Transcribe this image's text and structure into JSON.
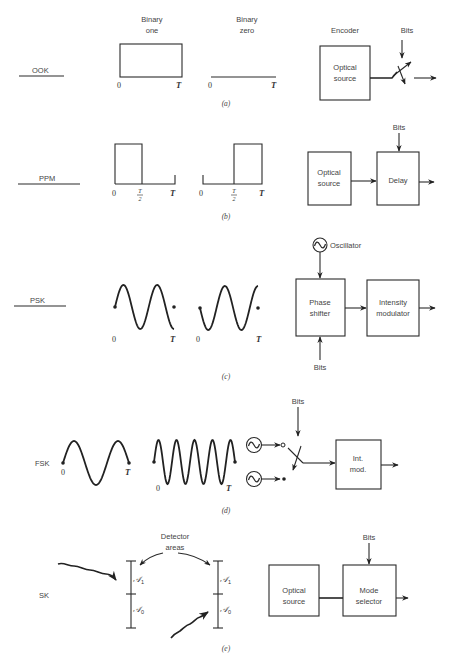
{
  "figure": {
    "panels": [
      {
        "id": "a",
        "caption": "(a)",
        "scheme": "OOK",
        "binary_one_label": "Binary\none",
        "binary_one_line1": "Binary",
        "binary_one_line2": "one",
        "binary_zero_line1": "Binary",
        "binary_zero_line2": "zero",
        "axis_start": "0",
        "axis_end": "T",
        "encoder_label": "Encoder",
        "source_line1": "Optical",
        "source_line2": "source",
        "bits_label": "Bits"
      },
      {
        "id": "b",
        "caption": "(b)",
        "scheme": "PPM",
        "axis_start": "0",
        "axis_mid_num": "T",
        "axis_mid_den": "2",
        "axis_end": "T",
        "source_line1": "Optical",
        "source_line2": "source",
        "delay_label": "Delay",
        "bits_label": "Bits"
      },
      {
        "id": "c",
        "caption": "(c)",
        "scheme": "PSK",
        "axis_start": "0",
        "axis_end": "T",
        "oscillator_label": "Oscillator",
        "shifter_line1": "Phase",
        "shifter_line2": "shifter",
        "modulator_line1": "Intensity",
        "modulator_line2": "modulator",
        "bits_label": "Bits"
      },
      {
        "id": "d",
        "caption": "(d)",
        "scheme": "FSK",
        "axis_start": "0",
        "axis_end": "T",
        "bits_label": "Bits",
        "mod_line1": "Int.",
        "mod_line2": "mod."
      },
      {
        "id": "e",
        "caption": "(e)",
        "scheme": "SK",
        "detector_line1": "Detector",
        "detector_line2": "areas",
        "area1_symbol": "𝒜",
        "area1_sub": "1",
        "area0_symbol": "𝒜",
        "area0_sub": "0",
        "source_line1": "Optical",
        "source_line2": "source",
        "selector_line1": "Mode",
        "selector_line2": "selector",
        "bits_label": "Bits"
      }
    ],
    "icons": {
      "oscillator": "sine-in-circle",
      "arrow": "arrowhead",
      "switch": "toggle-switch"
    },
    "colors": {
      "ink": "#222222",
      "label": "#444444",
      "background": "#ffffff"
    }
  }
}
